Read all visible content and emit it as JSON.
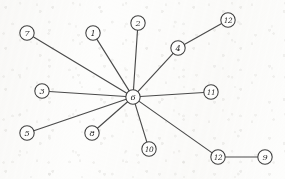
{
  "diagram": {
    "type": "graph",
    "title": "",
    "canvas": {
      "width": 285,
      "height": 179
    },
    "style": {
      "background_color": "#fdfdfc",
      "edge_color": "#4a4a4a",
      "node_fill_color": "#fdfdfc",
      "node_stroke_color": "#3f3f3f",
      "label_color": "#2a2a2a",
      "node_radius": 7.2
    },
    "nodes": [
      {
        "id": "n7",
        "label": "7",
        "x": 27,
        "y": 33
      },
      {
        "id": "n1",
        "label": "1",
        "x": 93,
        "y": 33
      },
      {
        "id": "n2",
        "label": "2",
        "x": 138,
        "y": 23
      },
      {
        "id": "n4",
        "label": "4",
        "x": 178,
        "y": 48
      },
      {
        "id": "n12a",
        "label": "12",
        "x": 228,
        "y": 20
      },
      {
        "id": "n3",
        "label": "3",
        "x": 42,
        "y": 91
      },
      {
        "id": "n6",
        "label": "6",
        "x": 133,
        "y": 97
      },
      {
        "id": "n11",
        "label": "11",
        "x": 211,
        "y": 92
      },
      {
        "id": "n5",
        "label": "5",
        "x": 27,
        "y": 133
      },
      {
        "id": "n8",
        "label": "8",
        "x": 92,
        "y": 133
      },
      {
        "id": "n10",
        "label": "10",
        "x": 149,
        "y": 149
      },
      {
        "id": "n12b",
        "label": "12",
        "x": 218,
        "y": 157
      },
      {
        "id": "n9",
        "label": "9",
        "x": 265,
        "y": 157
      }
    ],
    "edges": [
      {
        "from": "n6",
        "to": "n7"
      },
      {
        "from": "n6",
        "to": "n1"
      },
      {
        "from": "n6",
        "to": "n2"
      },
      {
        "from": "n6",
        "to": "n4"
      },
      {
        "from": "n6",
        "to": "n3"
      },
      {
        "from": "n6",
        "to": "n11"
      },
      {
        "from": "n6",
        "to": "n5"
      },
      {
        "from": "n6",
        "to": "n8"
      },
      {
        "from": "n6",
        "to": "n10"
      },
      {
        "from": "n6",
        "to": "n12b"
      },
      {
        "from": "n4",
        "to": "n12a"
      },
      {
        "from": "n12b",
        "to": "n9"
      }
    ]
  }
}
